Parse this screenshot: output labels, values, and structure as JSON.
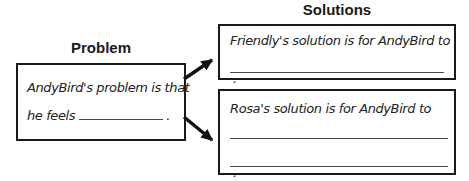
{
  "problem": {
    "title": "Problem",
    "line1": "AndyBird's problem is that",
    "line2_prefix": "he feels",
    "period": "."
  },
  "solutions": {
    "title": "Solutions",
    "friendly": {
      "text": "Friendly's solution is for AndyBird to",
      "period": "."
    },
    "rosa": {
      "text": "Rosa's solution is for AndyBird to",
      "period": "."
    }
  },
  "colors": {
    "background": "#ffffff",
    "box_border": "#1a1a1a",
    "handwriting_text": "#232323",
    "blank_line": "#4a4a4a",
    "arrow": "#111111"
  }
}
